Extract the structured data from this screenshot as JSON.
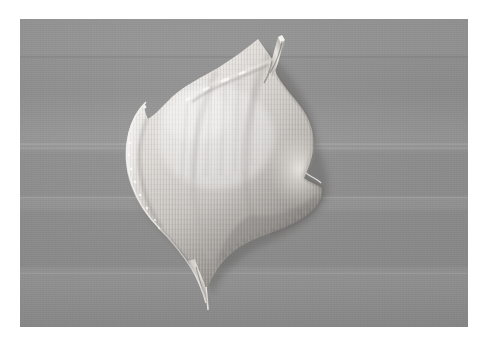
{
  "image": {
    "kind": "photograph",
    "subject": "cream-dollop",
    "description": "A pale whitish dollop of cream or soft paste smeared on a flat medium-gray background, photographed from above with a pointed peak at the top and a thin trailing drip at the bottom.",
    "width": 489,
    "height": 345,
    "border": {
      "name": "white-mat-border",
      "color": "#ffffff",
      "left": 20,
      "top": 19,
      "right": 21,
      "bottom": 18
    },
    "backdrop": {
      "name": "gray-backdrop",
      "base_color": "#8f8e8e",
      "light_color": "#999898",
      "dark_color": "#868686",
      "texture": "horizontal scanline banding with faint bright streaks",
      "panel": {
        "x": 20,
        "y": 19,
        "width": 448,
        "height": 308
      }
    },
    "subject_colors": {
      "highlight": "#f2f0ec",
      "midtone": "#d4d1cb",
      "shadow": "#9d9a95",
      "edge_shadow": "#6f6d6a",
      "deep_shadow": "#5d5b59"
    },
    "subject_bounds": {
      "x": 145,
      "y": 43,
      "width": 155,
      "height": 226
    },
    "features": [
      {
        "name": "top-peak",
        "label": "pointed peak",
        "x": 258,
        "y": 44
      },
      {
        "name": "left-point",
        "label": "left lobe tip",
        "x": 146,
        "y": 116
      },
      {
        "name": "right-lobe",
        "label": "right bulge",
        "x": 296,
        "y": 160
      },
      {
        "name": "bottom-tail",
        "label": "trailing drip",
        "x": 188,
        "y": 269
      }
    ]
  }
}
